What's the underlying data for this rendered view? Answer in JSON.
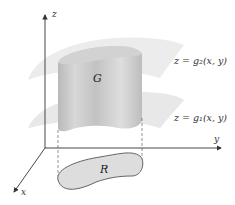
{
  "diagram": {
    "axes": {
      "z_label": "z",
      "y_label": "y",
      "x_label": "x"
    },
    "surfaces": {
      "upper_label": "z = g₂(x, y)",
      "lower_label": "z = g₁(x, y)"
    },
    "solid_label": "G",
    "region_label": "R",
    "colors": {
      "surface_fill": "#e6e6e6",
      "solid_fill": "#c8c8c8",
      "region_fill": "#dcdcdc",
      "axis_color": "#333333"
    }
  }
}
